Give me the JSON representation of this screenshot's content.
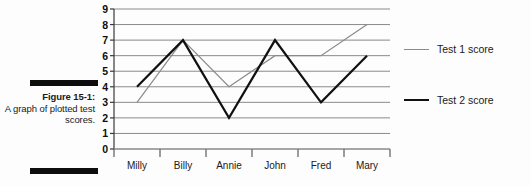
{
  "figure": {
    "caption_title": "Figure 15-1:",
    "caption_body": "A graph of plotted test scores."
  },
  "legend": {
    "position": "right",
    "entries": [
      {
        "label": "Test 1 score",
        "color": "#8a8a8a",
        "width": 1.2
      },
      {
        "label": "Test 2 score",
        "color": "#111111",
        "width": 2.2
      }
    ]
  },
  "axis": {
    "y_ticks": [
      "9",
      "8",
      "7",
      "6",
      "5",
      "4",
      "3",
      "2",
      "1",
      "0"
    ],
    "x_ticks": [
      "Milly",
      "Billy",
      "Annie",
      "John",
      "Fred",
      "Mary"
    ]
  },
  "chart_data": {
    "type": "line",
    "title": "",
    "xlabel": "",
    "ylabel": "",
    "categories": [
      "Milly",
      "Billy",
      "Annie",
      "John",
      "Fred",
      "Mary"
    ],
    "series": [
      {
        "name": "Test 1 score",
        "color": "#8a8a8a",
        "values": [
          3,
          7,
          4,
          6,
          6,
          8
        ]
      },
      {
        "name": "Test 2 score",
        "color": "#111111",
        "values": [
          4,
          7,
          2,
          7,
          3,
          6
        ]
      }
    ],
    "ylim": [
      0,
      9
    ],
    "ytick_step": 1,
    "grid": true,
    "grid_axis": "y",
    "markers": false,
    "legend_position": "right"
  }
}
